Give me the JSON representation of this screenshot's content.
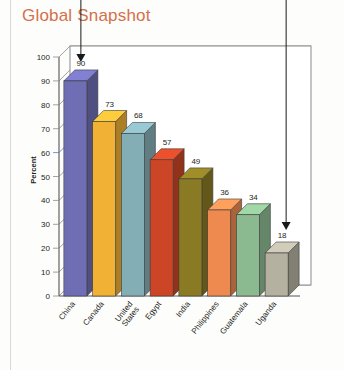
{
  "title": "Global Snapshot",
  "title_color": "#d4704a",
  "chart_data": {
    "type": "bar",
    "title": "Global Snapshot",
    "xlabel": "",
    "ylabel": "Percent",
    "ylim": [
      0,
      100
    ],
    "ytick_step": 10,
    "yticks": [
      0,
      10,
      20,
      30,
      40,
      50,
      60,
      70,
      80,
      90,
      100
    ],
    "grid": true,
    "legend": "none",
    "style": "3d-bar",
    "highlight_gridline": 60,
    "highlight_gridline_color": "#6a6ec4",
    "categories": [
      "China",
      "Canada",
      "United States",
      "Egypt",
      "India",
      "Philippines",
      "Guatemala",
      "Uganda"
    ],
    "values": [
      90,
      73,
      68,
      57,
      49,
      36,
      34,
      18
    ],
    "bar_colors": [
      "#6f6eb5",
      "#f0b134",
      "#84aeb6",
      "#cc4526",
      "#8a7a23",
      "#ee8a50",
      "#8cba90",
      "#b4b1a0"
    ]
  },
  "annotations": [
    {
      "name": "arrow-to-highest-bar",
      "target_value": 90,
      "target_category": "China"
    },
    {
      "name": "arrow-to-lowest-bar",
      "target_value": 18,
      "target_category": "Uganda"
    }
  ]
}
